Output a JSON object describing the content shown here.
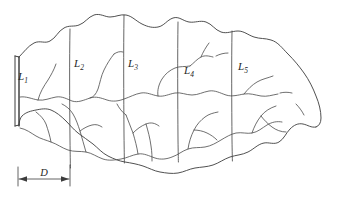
{
  "figure": {
    "type": "line-drawing",
    "background_color": "#ffffff",
    "line_color": "#3c3c3c",
    "width": 339,
    "height": 198
  },
  "labels": {
    "area_1": {
      "base": "L",
      "sub": "1"
    },
    "area_2": {
      "base": "L",
      "sub": "2"
    },
    "area_3": {
      "base": "L",
      "sub": "3"
    },
    "area_4": {
      "base": "L",
      "sub": "4"
    },
    "area_5": {
      "base": "L",
      "sub": "5"
    }
  },
  "dimension": {
    "label": "D",
    "start_x": 18,
    "end_x": 70,
    "y": 178
  },
  "label_positions": [
    {
      "name": "area-label-1",
      "x": 18,
      "y": 80
    },
    {
      "name": "area-label-2",
      "x": 74,
      "y": 67
    },
    {
      "name": "area-label-3",
      "x": 128,
      "y": 67
    },
    {
      "name": "area-label-4",
      "x": 184,
      "y": 74
    },
    {
      "name": "area-label-5",
      "x": 238,
      "y": 70
    }
  ],
  "dividers": [
    {
      "name": "divider-1",
      "x": 70
    },
    {
      "name": "divider-2",
      "x": 124
    },
    {
      "name": "divider-3",
      "x": 178
    },
    {
      "name": "divider-4",
      "x": 232
    }
  ],
  "dam": {
    "name": "dam-outlet",
    "x": 18,
    "top_y": 56,
    "bottom_y": 126
  }
}
